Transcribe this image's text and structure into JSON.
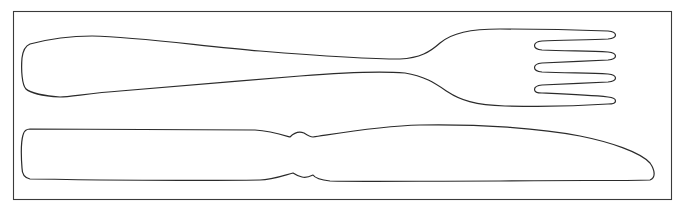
{
  "figure": {
    "description": "Line drawing of a fork (top) and a knife (bottom) inside a rectangular frame",
    "items": [
      {
        "name": "fork",
        "tines": 4
      },
      {
        "name": "knife"
      }
    ],
    "colors": {
      "background": "#ffffff",
      "stroke": "#2b2b2b",
      "frame": "#3a3a3a"
    }
  }
}
